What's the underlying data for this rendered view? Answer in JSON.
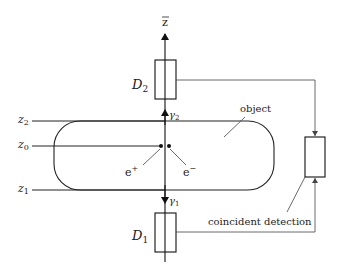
{
  "diagram": {
    "axis_label": "z⃗",
    "axis_label_text": "z",
    "detectors": [
      {
        "id": "D2",
        "label": "D",
        "sub": "2"
      },
      {
        "id": "D1",
        "label": "D",
        "sub": "1"
      }
    ],
    "photons": [
      {
        "id": "gamma2",
        "label": "γ",
        "sub": "2"
      },
      {
        "id": "gamma1",
        "label": "γ",
        "sub": "1"
      }
    ],
    "planes": [
      {
        "id": "z2",
        "label": "z",
        "sub": "2"
      },
      {
        "id": "z0",
        "label": "z",
        "sub": "0"
      },
      {
        "id": "z1",
        "label": "z",
        "sub": "1"
      }
    ],
    "particles": [
      {
        "id": "positron",
        "label": "e",
        "sup": "+"
      },
      {
        "id": "electron",
        "label": "e",
        "sup": "−"
      }
    ],
    "object_label": "object",
    "coincidence_label": "coincident detection"
  }
}
